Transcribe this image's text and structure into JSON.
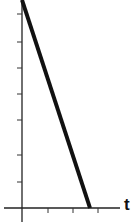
{
  "chart_data": {
    "type": "line",
    "title": "",
    "xlabel": "t",
    "ylabel": "",
    "x_tick_labels": [],
    "y_tick_labels": [],
    "x_ticks_count": 3,
    "y_ticks_count": 7,
    "grid": false,
    "legend": null,
    "series": [
      {
        "name": "line",
        "x": [
          0,
          2.7
        ],
        "y": [
          8,
          0
        ],
        "color": "#111111",
        "stroke_width": 4
      }
    ],
    "xlim": [
      -0.6,
      4
    ],
    "ylim": [
      -0.5,
      8
    ],
    "annotations": []
  },
  "axes": {
    "x_label": "t",
    "color": "#222222"
  },
  "layout": {
    "origin_px": [
      22,
      208
    ],
    "y_axis_top_px": 0,
    "y_axis_bottom_px": 222,
    "x_axis_left_px": 4,
    "x_axis_right_px": 120,
    "y_tick_px": [
      14,
      42,
      68,
      94,
      120,
      155,
      182
    ],
    "x_tick_px": [
      48,
      73,
      98
    ],
    "line_start_px": [
      22,
      0
    ],
    "line_end_px": [
      90,
      208
    ]
  }
}
